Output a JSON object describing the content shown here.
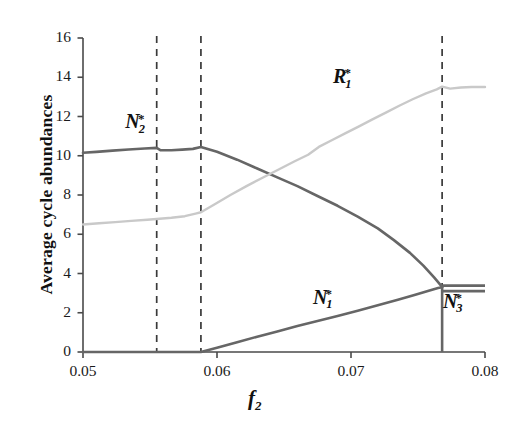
{
  "chart_data": {
    "type": "line",
    "title": "",
    "xlabel": "f_2",
    "ylabel": "Average cycle abundances",
    "xlim": [
      0.05,
      0.08
    ],
    "ylim": [
      0,
      16
    ],
    "xticks": [
      "0.05",
      "0.06",
      "0.07",
      "0.08"
    ],
    "xtick_values": [
      0.05,
      0.06,
      0.07,
      0.08
    ],
    "yticks": [
      "0",
      "2",
      "4",
      "6",
      "8",
      "10",
      "12",
      "14",
      "16"
    ],
    "ytick_values": [
      0,
      2,
      4,
      6,
      8,
      10,
      12,
      14,
      16
    ],
    "grid": false,
    "legend": "inline-annotations",
    "colors": {
      "dark_curve": "#666666",
      "light_curve": "#c9c9c9",
      "axis": "#4a4a4a",
      "dashed_line": "#3a3a3a",
      "text": "#111111"
    },
    "vertical_dashed_lines": [
      {
        "name": "threshold-1",
        "x": 0.0555
      },
      {
        "name": "threshold-2",
        "x": 0.0588
      },
      {
        "name": "threshold-3",
        "x": 0.0768
      }
    ],
    "series": [
      {
        "name": "N2*",
        "label": "N",
        "sub": "2",
        "sup": "*",
        "color": "#666666",
        "width": 2.6,
        "points": [
          [
            0.05,
            10.15
          ],
          [
            0.051,
            10.2
          ],
          [
            0.0522,
            10.26
          ],
          [
            0.0534,
            10.32
          ],
          [
            0.0546,
            10.37
          ],
          [
            0.0555,
            10.4
          ],
          [
            0.0558,
            10.28
          ],
          [
            0.0566,
            10.28
          ],
          [
            0.0574,
            10.31
          ],
          [
            0.0582,
            10.35
          ],
          [
            0.0588,
            10.45
          ],
          [
            0.06,
            10.2
          ],
          [
            0.0615,
            9.8
          ],
          [
            0.063,
            9.35
          ],
          [
            0.0645,
            8.9
          ],
          [
            0.066,
            8.45
          ],
          [
            0.0675,
            7.95
          ],
          [
            0.069,
            7.45
          ],
          [
            0.0705,
            6.9
          ],
          [
            0.072,
            6.3
          ],
          [
            0.0732,
            5.7
          ],
          [
            0.0744,
            5.05
          ],
          [
            0.0754,
            4.4
          ],
          [
            0.0762,
            3.8
          ],
          [
            0.0768,
            3.32
          ]
        ]
      },
      {
        "name": "N1*",
        "label": "N",
        "sub": "1",
        "sup": "*",
        "color": "#666666",
        "width": 2.6,
        "points": [
          [
            0.05,
            0.0
          ],
          [
            0.0555,
            0.0
          ],
          [
            0.0588,
            0.0
          ],
          [
            0.06,
            0.22
          ],
          [
            0.0615,
            0.5
          ],
          [
            0.063,
            0.78
          ],
          [
            0.0645,
            1.05
          ],
          [
            0.066,
            1.32
          ],
          [
            0.0675,
            1.58
          ],
          [
            0.069,
            1.84
          ],
          [
            0.0705,
            2.1
          ],
          [
            0.072,
            2.38
          ],
          [
            0.0735,
            2.66
          ],
          [
            0.0748,
            2.92
          ],
          [
            0.0758,
            3.12
          ],
          [
            0.0765,
            3.26
          ],
          [
            0.0768,
            3.3
          ]
        ]
      },
      {
        "name": "N3*",
        "label": "N",
        "sub": "3",
        "sup": "*",
        "color": "#666666",
        "width": 2.6,
        "branches": [
          {
            "kind": "vertical-drop",
            "x": 0.0768,
            "y_from": 3.35,
            "y_to": 0.0
          },
          {
            "kind": "plateau-upper",
            "y": 3.38,
            "x_from": 0.0768,
            "x_to": 0.08
          },
          {
            "kind": "plateau-lower",
            "y": 3.1,
            "x_from": 0.0768,
            "x_to": 0.08
          }
        ]
      },
      {
        "name": "R1*",
        "label": "R",
        "sub": "1",
        "sup": "*",
        "color": "#c9c9c9",
        "width": 2.4,
        "points": [
          [
            0.05,
            6.5
          ],
          [
            0.0512,
            6.56
          ],
          [
            0.0524,
            6.62
          ],
          [
            0.0536,
            6.68
          ],
          [
            0.0548,
            6.74
          ],
          [
            0.0555,
            6.78
          ],
          [
            0.0566,
            6.84
          ],
          [
            0.0576,
            6.92
          ],
          [
            0.0584,
            7.05
          ],
          [
            0.0588,
            7.12
          ],
          [
            0.0598,
            7.52
          ],
          [
            0.061,
            8.0
          ],
          [
            0.0622,
            8.45
          ],
          [
            0.0634,
            8.88
          ],
          [
            0.0646,
            9.3
          ],
          [
            0.0658,
            9.72
          ],
          [
            0.0668,
            10.05
          ],
          [
            0.0676,
            10.45
          ],
          [
            0.0686,
            10.8
          ],
          [
            0.0696,
            11.15
          ],
          [
            0.0706,
            11.5
          ],
          [
            0.0716,
            11.85
          ],
          [
            0.0726,
            12.2
          ],
          [
            0.0736,
            12.55
          ],
          [
            0.0746,
            12.88
          ],
          [
            0.0756,
            13.18
          ],
          [
            0.0764,
            13.38
          ],
          [
            0.0768,
            13.52
          ],
          [
            0.0774,
            13.42
          ],
          [
            0.0782,
            13.48
          ],
          [
            0.079,
            13.5
          ],
          [
            0.08,
            13.5
          ]
        ]
      }
    ],
    "annotations": [
      {
        "name": "label-N2",
        "text": "N2*",
        "x": 0.0545,
        "y": 11.6
      },
      {
        "name": "label-R1",
        "text": "R1*",
        "x": 0.07,
        "y": 13.9
      },
      {
        "name": "label-N1",
        "text": "N1*",
        "x": 0.0685,
        "y": 2.65
      },
      {
        "name": "label-N3",
        "text": "N3*",
        "x": 0.0782,
        "y": 2.45
      }
    ]
  },
  "axis": {
    "y_title": "Average cycle abundances",
    "x_title_base": "f",
    "x_title_sub": "2"
  },
  "labels": {
    "n2": {
      "base": "N",
      "sub": "2",
      "sup": "*"
    },
    "n1": {
      "base": "N",
      "sub": "1",
      "sup": "*"
    },
    "n3": {
      "base": "N",
      "sub": "3",
      "sup": "*"
    },
    "r1": {
      "base": "R",
      "sub": "1",
      "sup": "*"
    }
  }
}
